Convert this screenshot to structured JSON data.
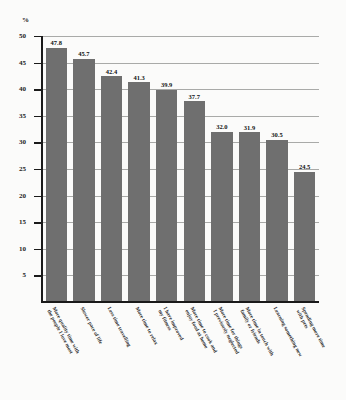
{
  "chart_data": {
    "type": "bar",
    "title": "",
    "xlabel": "",
    "ylabel": "%",
    "ylim": [
      0,
      50
    ],
    "yticks": [
      5,
      10,
      15,
      20,
      25,
      30,
      35,
      40,
      45,
      50
    ],
    "grid": true,
    "legend": "none",
    "bar_color": "#6f6f6f",
    "categories": [
      "More quality time with\nthe people I love most",
      "Slower pace of life",
      "Less time travelling",
      "More time to relax",
      "I have improved\nmy fitness",
      "More time to cook and\nenjoy food at home",
      "More time for things\nI previously neglected",
      "More time in touch with\nfamily or friends",
      "Learning something new",
      "Spending more time\nwith pets"
    ],
    "values": [
      47.8,
      45.7,
      42.4,
      41.3,
      39.9,
      37.7,
      32.0,
      31.9,
      30.5,
      24.5
    ],
    "value_labels": [
      "47.8",
      "45.7",
      "42.4",
      "41.3",
      "39.9",
      "37.7",
      "32.0",
      "31.9",
      "30.5",
      "24.5"
    ]
  },
  "axis": {
    "unit_label": "%",
    "tick_labels": [
      "50",
      "45",
      "40",
      "35",
      "30",
      "25",
      "20",
      "15",
      "10",
      "5"
    ]
  }
}
